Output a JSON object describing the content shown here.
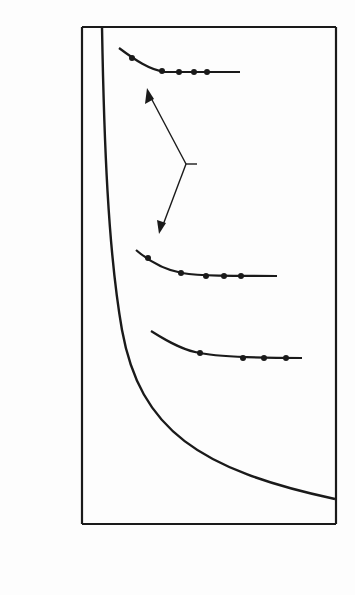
{
  "chart_data": {
    "type": "line",
    "title": "",
    "xlabel": "E_b/N_o, dB",
    "xlabel_main": "E",
    "xlabel_sub1": "b",
    "xlabel_mid": "/N",
    "xlabel_sub2": "o",
    "xlabel_tail": ", dB",
    "ylabel": "W/R, Hz/bps",
    "xlim": [
      -3,
      13
    ],
    "ylim": [
      0.1,
      100
    ],
    "yscale": "log",
    "grid": false,
    "x_ticks": [
      "-2",
      "0",
      "2",
      "4",
      "6",
      "8",
      "10",
      "12"
    ],
    "y_ticks": [
      "100",
      "10",
      "1.0",
      "0.1"
    ],
    "series": [
      {
        "name": "Channel capacity",
        "label_line1": "Channel",
        "label_line2": "capacity",
        "x": [
          -1.6,
          -1.4,
          -1.0,
          0,
          1,
          2,
          4,
          6,
          8,
          10,
          13
        ],
        "y": [
          100,
          25,
          10,
          4.0,
          2.0,
          1.2,
          0.55,
          0.33,
          0.23,
          0.18,
          0.14
        ]
      },
      {
        "name": "Biorthogonal, 10 bits per character",
        "label_line1": "10 bits per",
        "label_line2": "character",
        "x": [
          -0.2,
          1.7,
          2.9,
          3.8,
          4.6
        ],
        "y": [
          64,
          53,
          52,
          52,
          52
        ],
        "point_labels": [
          "10^-1",
          "",
          "10^-3",
          "",
          "10^-5"
        ]
      },
      {
        "name": "Biorthogonal, 5 bits per character",
        "label_line1": "5 bits per",
        "label_line2": "character",
        "x": [
          0.8,
          2.9,
          4.5,
          5.6,
          6.7
        ],
        "y": [
          4.0,
          3.2,
          3.1,
          3.1,
          3.1
        ],
        "point_labels": [
          "10^-1",
          "",
          "10^-3",
          "",
          "10^-5"
        ]
      },
      {
        "name": "Coherent biphase",
        "label_line1": "Coherent",
        "label_line2": "biphase",
        "x": [
          4.2,
          6.9,
          8.3,
          9.7
        ],
        "y": [
          1.06,
          1.0,
          1.0,
          1.0
        ],
        "point_labels": [
          "10^-2",
          "10^-3",
          "",
          "10^-5"
        ]
      }
    ],
    "annotations": [
      {
        "text": "Biorthogonal",
        "points_to": [
          "10 bits per character",
          "5 bits per character"
        ]
      }
    ],
    "point_label_base": "10",
    "exp": {
      "m1": "−1",
      "m2": "−2",
      "m3": "−3",
      "m5": "−5"
    }
  }
}
